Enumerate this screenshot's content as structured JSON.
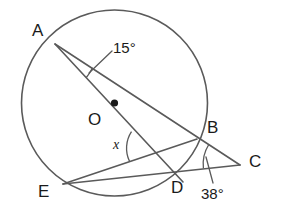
{
  "figure": {
    "type": "circle-geometry-diagram",
    "stroke_color": "#5a5a5a",
    "label_color": "#1a1a1a",
    "background_color": "#ffffff",
    "circle": {
      "center_label": "O",
      "center_x": 114.5,
      "center_y": 103,
      "radius": 93
    },
    "points": [
      {
        "name": "A",
        "label": "A",
        "x": 55,
        "y": 44,
        "on_circle": true
      },
      {
        "name": "B",
        "label": "B",
        "x": 197,
        "y": 139,
        "on_circle": true
      },
      {
        "name": "C",
        "label": "C",
        "x": 240,
        "y": 165,
        "on_circle": false
      },
      {
        "name": "D",
        "label": "D",
        "x": 174,
        "y": 175,
        "on_circle": true
      },
      {
        "name": "E",
        "label": "E",
        "x": 63,
        "y": 184,
        "on_circle": true
      },
      {
        "name": "O",
        "label": "O",
        "x": 114.5,
        "y": 103,
        "on_circle": false
      }
    ],
    "segments": [
      {
        "name": "A-to-C-through-B",
        "from": "A",
        "to": "C"
      },
      {
        "name": "A-to-C-through-D",
        "from": "A",
        "to": "C"
      },
      {
        "name": "E-to-C-through-D",
        "from": "E",
        "to": "C"
      },
      {
        "name": "E-to-B",
        "from": "E",
        "to": "B"
      }
    ],
    "angles": [
      {
        "name": "angle-at-A",
        "label": "15°",
        "value": 15,
        "unit": "degrees",
        "vertex": "A",
        "has_leader_line": true
      },
      {
        "name": "angle-at-C",
        "label": "38°",
        "value": 38,
        "unit": "degrees",
        "vertex": "C",
        "has_leader_line": true
      },
      {
        "name": "unknown-angle",
        "label": "x",
        "value": null,
        "unit": "degrees",
        "vertex": "intersection-of-AD-and-EB",
        "has_leader_line": false
      }
    ]
  }
}
